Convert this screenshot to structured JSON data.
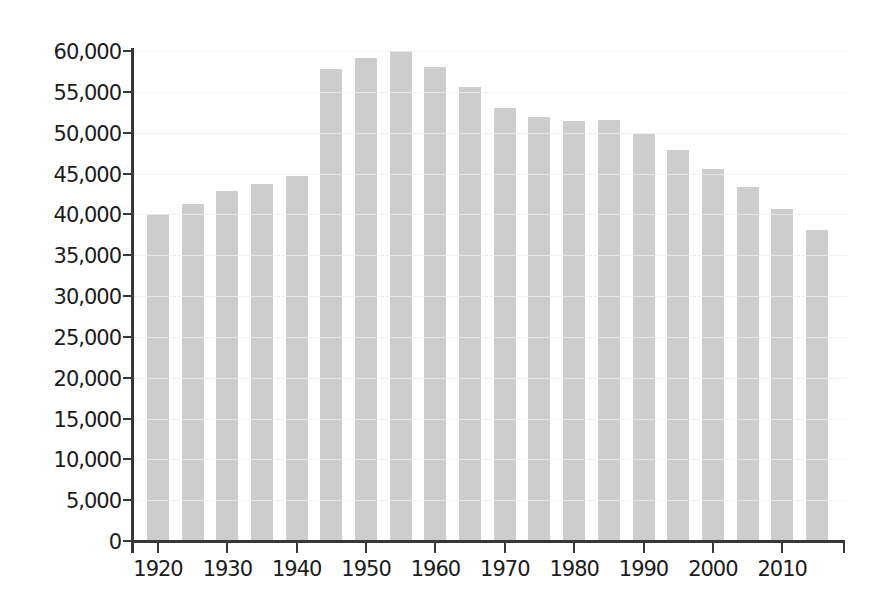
{
  "chart_data": {
    "type": "bar",
    "title": "",
    "xlabel": "",
    "ylabel": "",
    "categories": [
      "1920",
      "1925",
      "1930",
      "1935",
      "1940",
      "1945",
      "1950",
      "1955",
      "1960",
      "1965",
      "1970",
      "1975",
      "1980",
      "1985",
      "1990",
      "1995",
      "2000",
      "2005",
      "2010",
      "2015"
    ],
    "values": [
      40000,
      41300,
      42900,
      43700,
      44700,
      57800,
      59100,
      60000,
      58000,
      55600,
      53000,
      51900,
      51400,
      51600,
      49800,
      47900,
      45600,
      43400,
      40600,
      38100
    ],
    "ylim": [
      0,
      60000
    ],
    "ytick_interval": 5000,
    "ytick_labels": [
      "0",
      "5,000",
      "10,000",
      "15,000",
      "20,000",
      "25,000",
      "30,000",
      "35,000",
      "40,000",
      "45,000",
      "50,000",
      "55,000",
      "60,000"
    ],
    "xtick_labels": [
      "1920",
      "1930",
      "1940",
      "1950",
      "1960",
      "1970",
      "1980",
      "1990",
      "2000",
      "2010"
    ],
    "grid": "horizontal-dotted",
    "legend": "none",
    "colors": {
      "bar": "#cdcdcd",
      "axis": "#383838",
      "gridline": "#9f9f9f",
      "text": "#1c1c1c",
      "background": "#ffffff"
    }
  }
}
